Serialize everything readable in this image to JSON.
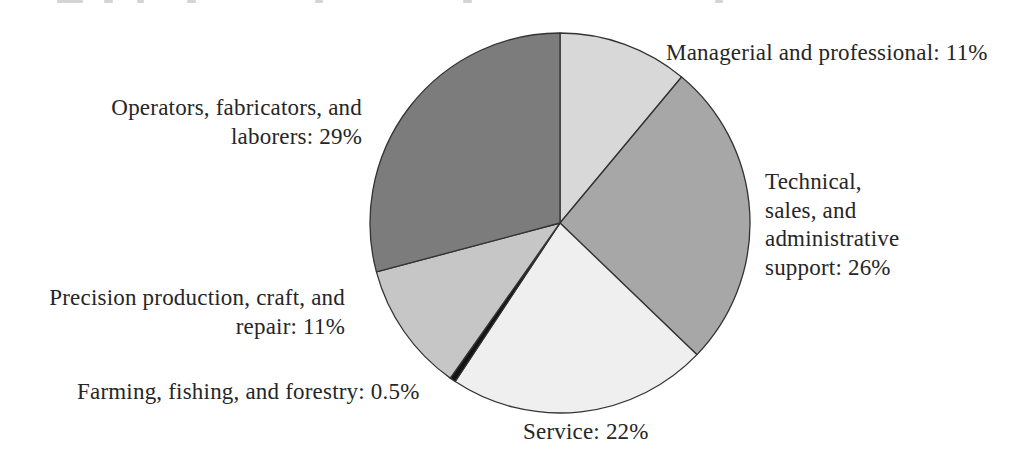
{
  "chart_data": {
    "type": "pie",
    "title": "",
    "direction": "clockwise",
    "start_position": "12 o'clock",
    "legend": "none",
    "labels_position": "around",
    "background": "#ffffff",
    "outline_color": "#333333",
    "text_color": "#262626",
    "slices": [
      {
        "id": "managerial",
        "category": "Managerial and professional",
        "value": 11,
        "unit": "%",
        "color": "#d8d8d8",
        "label_text": "Managerial and professional: 11%"
      },
      {
        "id": "technical",
        "category": "Technical, sales, and administrative support",
        "value": 26,
        "unit": "%",
        "color": "#a7a7a7",
        "label_text": "Technical,\nsales, and\nadministrative\nsupport: 26%"
      },
      {
        "id": "service",
        "category": "Service",
        "value": 22,
        "unit": "%",
        "color": "#efefef",
        "label_text": "Service: 22%"
      },
      {
        "id": "farming",
        "category": "Farming, fishing, and forestry",
        "value": 0.5,
        "unit": "%",
        "color": "#141414",
        "label_text": "Farming, fishing, and forestry: 0.5%"
      },
      {
        "id": "precision",
        "category": "Precision production, craft, and repair",
        "value": 11,
        "unit": "%",
        "color": "#c6c6c6",
        "label_text": "Precision production, craft, and\nrepair: 11%"
      },
      {
        "id": "operators",
        "category": "Operators, fabricators, and laborers",
        "value": 29,
        "unit": "%",
        "color": "#7c7c7c",
        "label_text": "Operators, fabricators, and\nlaborers: 29%"
      }
    ]
  }
}
